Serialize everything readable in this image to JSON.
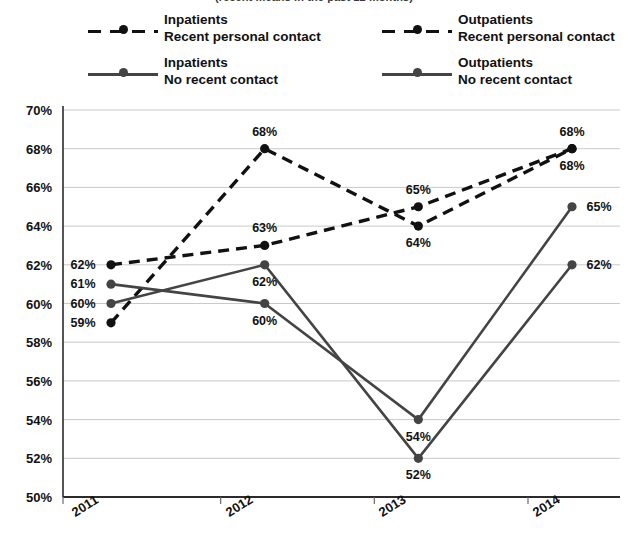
{
  "subtitle": "(recent means in the past 12 months)",
  "legend": {
    "items": [
      {
        "group": "Inpatients",
        "contact": "Recent personal contact",
        "style": "dashed",
        "color": "#111111"
      },
      {
        "group": "Outpatients",
        "contact": "Recent personal contact",
        "style": "dashed",
        "color": "#111111"
      },
      {
        "group": "Inpatients",
        "contact": "No recent contact",
        "style": "solid",
        "color": "#444444"
      },
      {
        "group": "Outpatients",
        "contact": "No recent contact",
        "style": "solid",
        "color": "#444444"
      }
    ]
  },
  "chart_data": {
    "type": "line",
    "title": "",
    "subtitle": "(recent means in the past 12 months)",
    "xlabel": "",
    "ylabel": "",
    "categories": [
      "2011",
      "2012",
      "2013",
      "2014"
    ],
    "ylim": [
      50,
      70
    ],
    "ytick_step": 2,
    "ytick_labels": [
      "50%",
      "52%",
      "54%",
      "56%",
      "58%",
      "60%",
      "62%",
      "64%",
      "66%",
      "68%",
      "70%"
    ],
    "ytick_values": [
      50,
      52,
      54,
      56,
      58,
      60,
      62,
      64,
      66,
      68,
      70
    ],
    "grid": true,
    "legend_position": "top",
    "value_suffix": "%",
    "series": [
      {
        "name": "Inpatients Recent personal contact",
        "style": "dashed",
        "color": "#111111",
        "values": [
          62,
          63,
          65,
          68
        ],
        "labels": [
          "62%",
          "63%",
          "65%",
          "68%"
        ],
        "label_pos": [
          "left",
          "above",
          "above",
          "above"
        ]
      },
      {
        "name": "Outpatients Recent personal contact",
        "style": "dashed",
        "color": "#111111",
        "values": [
          59,
          68,
          64,
          68
        ],
        "labels": [
          "59%",
          "68%",
          "64%",
          "68%"
        ],
        "label_pos": [
          "left",
          "above",
          "below",
          "below"
        ]
      },
      {
        "name": "Inpatients No recent contact",
        "style": "solid",
        "color": "#444444",
        "values": [
          61,
          60,
          54,
          65
        ],
        "labels": [
          "61%",
          "60%",
          "54%",
          "65%"
        ],
        "label_pos": [
          "left",
          "below",
          "below",
          "right"
        ]
      },
      {
        "name": "Outpatients No recent contact",
        "style": "solid",
        "color": "#444444",
        "values": [
          60,
          62,
          52,
          62
        ],
        "labels": [
          "60%",
          "62%",
          "52%",
          "62%"
        ],
        "label_pos": [
          "left",
          "below",
          "below",
          "right"
        ]
      }
    ]
  }
}
